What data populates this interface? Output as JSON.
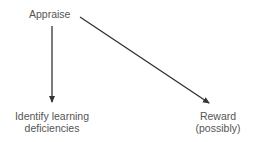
{
  "diagram": {
    "nodes": [
      {
        "id": "appraise",
        "label": "Appraise"
      },
      {
        "id": "identify",
        "line1": "Identify learning",
        "line2": "deficiencies"
      },
      {
        "id": "reward",
        "line1": "Reward",
        "line2": "(possibly)"
      }
    ],
    "edges": [
      {
        "from": "appraise",
        "to": "identify"
      },
      {
        "from": "appraise",
        "to": "reward"
      }
    ],
    "colors": {
      "line": "#333333",
      "text": "#555555"
    }
  }
}
